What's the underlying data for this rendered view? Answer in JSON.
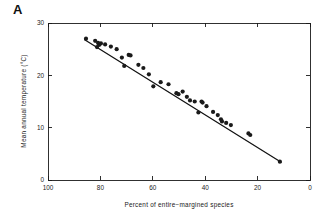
{
  "figure": {
    "panel_letter": "A"
  },
  "chart_data": {
    "type": "scatter",
    "title": "",
    "xlabel": "Percent of entire−margined species",
    "ylabel": "Mean annual temperature (°C)",
    "xlim": [
      100,
      0
    ],
    "ylim": [
      0,
      30
    ],
    "x_ticks": [
      100,
      80,
      60,
      40,
      20,
      0
    ],
    "x_tick_labels": [
      "100",
      "80",
      "60",
      "40",
      "20",
      "0"
    ],
    "y_ticks": [
      0,
      10,
      20,
      30
    ],
    "y_tick_labels": [
      "0",
      "10",
      "20",
      "30"
    ],
    "x_axis_reversed": true,
    "grid": false,
    "legend": null,
    "point_color": "#1a1a1a",
    "line_color": "#111111",
    "frame_color": "#1a1a1a",
    "background_color": "#ffffff",
    "series": [
      {
        "name": "Sites",
        "marker": "filled-circle",
        "points": [
          [
            85.5,
            27.0
          ],
          [
            82.0,
            26.6
          ],
          [
            81.3,
            25.4
          ],
          [
            80.9,
            26.2
          ],
          [
            80.5,
            25.8
          ],
          [
            79.8,
            26.1
          ],
          [
            78.2,
            25.9
          ],
          [
            76.0,
            25.5
          ],
          [
            73.8,
            25.0
          ],
          [
            71.8,
            23.4
          ],
          [
            70.9,
            21.8
          ],
          [
            69.2,
            23.9
          ],
          [
            68.5,
            23.8
          ],
          [
            65.5,
            22.0
          ],
          [
            63.6,
            21.4
          ],
          [
            61.5,
            20.2
          ],
          [
            59.8,
            17.9
          ],
          [
            57.0,
            18.7
          ],
          [
            54.0,
            18.3
          ],
          [
            51.0,
            16.6
          ],
          [
            50.2,
            16.4
          ],
          [
            48.6,
            16.9
          ],
          [
            47.0,
            15.9
          ],
          [
            45.8,
            15.2
          ],
          [
            44.0,
            15.0
          ],
          [
            42.6,
            12.9
          ],
          [
            41.4,
            15.0
          ],
          [
            41.0,
            14.8
          ],
          [
            39.5,
            14.1
          ],
          [
            37.0,
            13.0
          ],
          [
            35.2,
            12.4
          ],
          [
            34.0,
            11.6
          ],
          [
            33.6,
            11.2
          ],
          [
            32.0,
            10.9
          ],
          [
            30.2,
            10.5
          ],
          [
            23.5,
            8.9
          ],
          [
            22.8,
            8.6
          ],
          [
            11.5,
            3.5
          ]
        ]
      }
    ],
    "fit_line": {
      "name": "Least-squares regression",
      "x_start": 86.0,
      "y_start": 26.8,
      "x_end": 11.0,
      "y_end": 3.4
    }
  }
}
